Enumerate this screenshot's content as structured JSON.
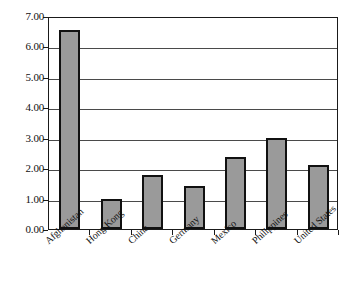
{
  "chart_data": {
    "type": "bar",
    "title": "",
    "subtitle": "",
    "xlabel": "",
    "ylabel": "",
    "categories": [
      "Afghanistan",
      "Hong Kong",
      "China",
      "Germany",
      "Mexico",
      "Philippines",
      "United States"
    ],
    "values": [
      6.55,
      1.0,
      1.78,
      1.42,
      2.38,
      3.0,
      2.12
    ],
    "ylim": [
      0.0,
      7.0
    ],
    "ytick_values": [
      0.0,
      1.0,
      2.0,
      3.0,
      4.0,
      5.0,
      6.0,
      7.0
    ],
    "ytick_labels": [
      "0.00",
      "1.00",
      "2.00",
      "3.00",
      "4.00",
      "5.00",
      "6.00",
      "7.00"
    ],
    "ytick_step": 1.0,
    "grid": true,
    "grid_axis": "y",
    "legend": false,
    "legend_position": "none",
    "bar_fill_color": "#9a9a9a",
    "bar_border_color": "#111111",
    "plot_border_color": "#1a1a1a",
    "gridline_color": "#4a4a4a",
    "background_color": "#ffffff",
    "xtick_label_rotation": -42
  }
}
